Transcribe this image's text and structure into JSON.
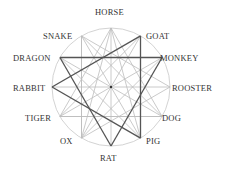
{
  "center": {
    "x": 111,
    "y": 87
  },
  "radius": 59,
  "colors": {
    "circle": "#c8c8c8",
    "light_line": "#bdbdbd",
    "dark_line": "#555555",
    "center_dot": "#333333",
    "text": "#333333"
  },
  "signs": [
    {
      "name": "HORSE",
      "angle": 0,
      "label_x": 95,
      "label_y": 8,
      "align": "left"
    },
    {
      "name": "GOAT",
      "angle": 30,
      "label_x": 146,
      "label_y": 32,
      "align": "left"
    },
    {
      "name": "MONKEY",
      "angle": 60,
      "label_x": 160,
      "label_y": 54,
      "align": "left"
    },
    {
      "name": "ROOSTER",
      "angle": 90,
      "label_x": 172,
      "label_y": 84,
      "align": "left"
    },
    {
      "name": "DOG",
      "angle": 120,
      "label_x": 162,
      "label_y": 114,
      "align": "left"
    },
    {
      "name": "PIG",
      "angle": 150,
      "label_x": 146,
      "label_y": 137,
      "align": "left"
    },
    {
      "name": "RAT",
      "angle": 180,
      "label_x": 100,
      "label_y": 154,
      "align": "left"
    },
    {
      "name": "OX",
      "angle": 210,
      "label_x": 60,
      "label_y": 137,
      "align": "left"
    },
    {
      "name": "TIGER",
      "angle": 240,
      "label_x": 25,
      "label_y": 114,
      "align": "left"
    },
    {
      "name": "RABBIT",
      "angle": 270,
      "label_x": 13,
      "label_y": 84,
      "align": "left"
    },
    {
      "name": "DRAGON",
      "angle": 300,
      "label_x": 13,
      "label_y": 54,
      "align": "left"
    },
    {
      "name": "SNAKE",
      "angle": 330,
      "label_x": 43,
      "label_y": 32,
      "align": "left"
    }
  ],
  "trines": [
    {
      "members": [
        "GOAT",
        "RABBIT",
        "PIG"
      ],
      "style": "dark"
    },
    {
      "members": [
        "DRAGON",
        "MONKEY",
        "RAT"
      ],
      "style": "dark"
    },
    {
      "members": [
        "HORSE",
        "TIGER",
        "DOG"
      ],
      "style": "light"
    },
    {
      "members": [
        "SNAKE",
        "ROOSTER",
        "OX"
      ],
      "style": "light"
    }
  ],
  "light_chords": [
    [
      "HORSE",
      "RAT"
    ],
    [
      "GOAT",
      "OX"
    ],
    [
      "MONKEY",
      "TIGER"
    ],
    [
      "ROOSTER",
      "RABBIT"
    ],
    [
      "DOG",
      "DRAGON"
    ],
    [
      "PIG",
      "SNAKE"
    ],
    [
      "SNAKE",
      "OX"
    ],
    [
      "TIGER",
      "DOG"
    ],
    [
      "HORSE",
      "OX"
    ],
    [
      "HORSE",
      "PIG"
    ],
    [
      "SNAKE",
      "DOG"
    ],
    [
      "GOAT",
      "TIGER"
    ],
    [
      "OX",
      "MONKEY"
    ],
    [
      "PIG",
      "DRAGON"
    ]
  ]
}
